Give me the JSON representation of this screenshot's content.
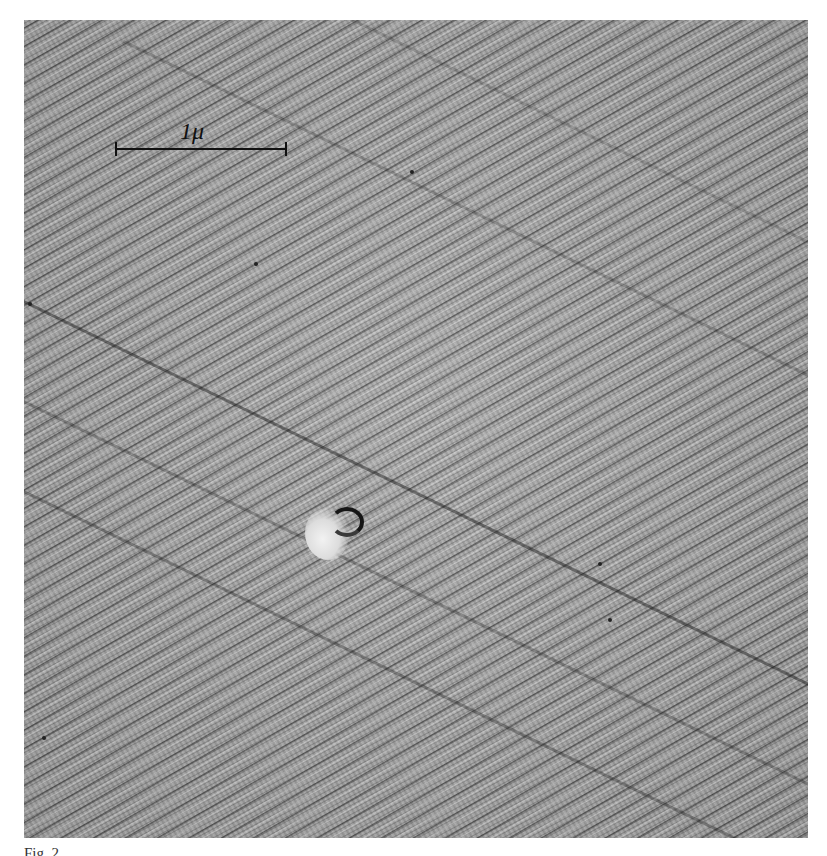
{
  "figure": {
    "type": "electron micrograph",
    "scale_bar": {
      "label": "1μ"
    },
    "caption": "Fig. 2. ..."
  }
}
